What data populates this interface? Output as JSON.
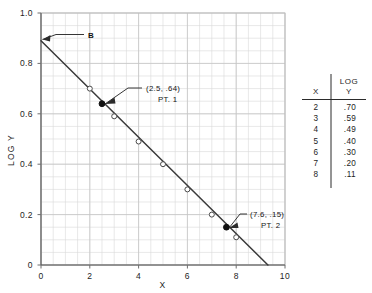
{
  "chart_data": {
    "type": "scatter",
    "title": "",
    "xlabel": "X",
    "ylabel": "LOG Y",
    "xlim": [
      0,
      10
    ],
    "ylim": [
      0,
      1.0
    ],
    "grid": true,
    "x_ticks": [
      "0",
      "2",
      "4",
      "6",
      "8",
      "10"
    ],
    "x_tick_values": [
      0,
      2,
      4,
      6,
      8,
      10
    ],
    "y_ticks": [
      "0",
      "0.2",
      "0.4",
      "0.6",
      "0.8",
      "1.0"
    ],
    "y_tick_values": [
      0,
      0.2,
      0.4,
      0.6,
      0.8,
      1.0
    ],
    "x_minor_step": 0.5,
    "y_minor_step": 0.05,
    "x": [
      2,
      3,
      4,
      5,
      6,
      7,
      8
    ],
    "values": [
      0.7,
      0.59,
      0.49,
      0.4,
      0.3,
      0.2,
      0.11
    ],
    "marker": "open-circle",
    "fit_line": {
      "x_start": 0.0,
      "y_start": 0.89,
      "x_end": 9.3,
      "y_end": 0.0
    },
    "highlight_points": [
      {
        "label": "PT. 1",
        "coord_label": "(2.5, .64)",
        "x": 2.5,
        "y": 0.64,
        "marker": "filled-circle"
      },
      {
        "label": "PT. 2",
        "coord_label": "(7.6, .15)",
        "x": 7.6,
        "y": 0.15,
        "marker": "filled-circle"
      }
    ],
    "annotations": [
      {
        "name": "intercept",
        "text": "B",
        "x": 0.0,
        "y": 0.89
      }
    ]
  },
  "axes": {
    "x_label": "X",
    "y_label": "LOG Y",
    "x_ticks": [
      "0",
      "2",
      "4",
      "6",
      "8",
      "10"
    ],
    "y_ticks": [
      "0",
      "0.2",
      "0.4",
      "0.6",
      "0.8",
      "1.0"
    ]
  },
  "callouts": {
    "intercept_label": "B",
    "pt1_coords": "(2.5, .64)",
    "pt1_label": "PT. 1",
    "pt2_coords": "(7.6, .15)",
    "pt2_label": "PT. 2"
  },
  "table": {
    "header_x": "X",
    "header_y_line1": "LOG",
    "header_y_line2": "Y",
    "rows": [
      {
        "x": "2",
        "logy": ".70"
      },
      {
        "x": "3",
        "logy": ".59"
      },
      {
        "x": "4",
        "logy": ".49"
      },
      {
        "x": "5",
        "logy": ".40"
      },
      {
        "x": "6",
        "logy": ".30"
      },
      {
        "x": "7",
        "logy": ".20"
      },
      {
        "x": "8",
        "logy": ".11"
      }
    ]
  },
  "colors": {
    "grid": "#d8d8d8",
    "axis": "#6f6f6f",
    "line": "#3a3a3a",
    "text": "#1a1a1a",
    "marker_fill": "#ffffff",
    "marker_edge": "#4a4a4a",
    "highlight": "#111111"
  }
}
